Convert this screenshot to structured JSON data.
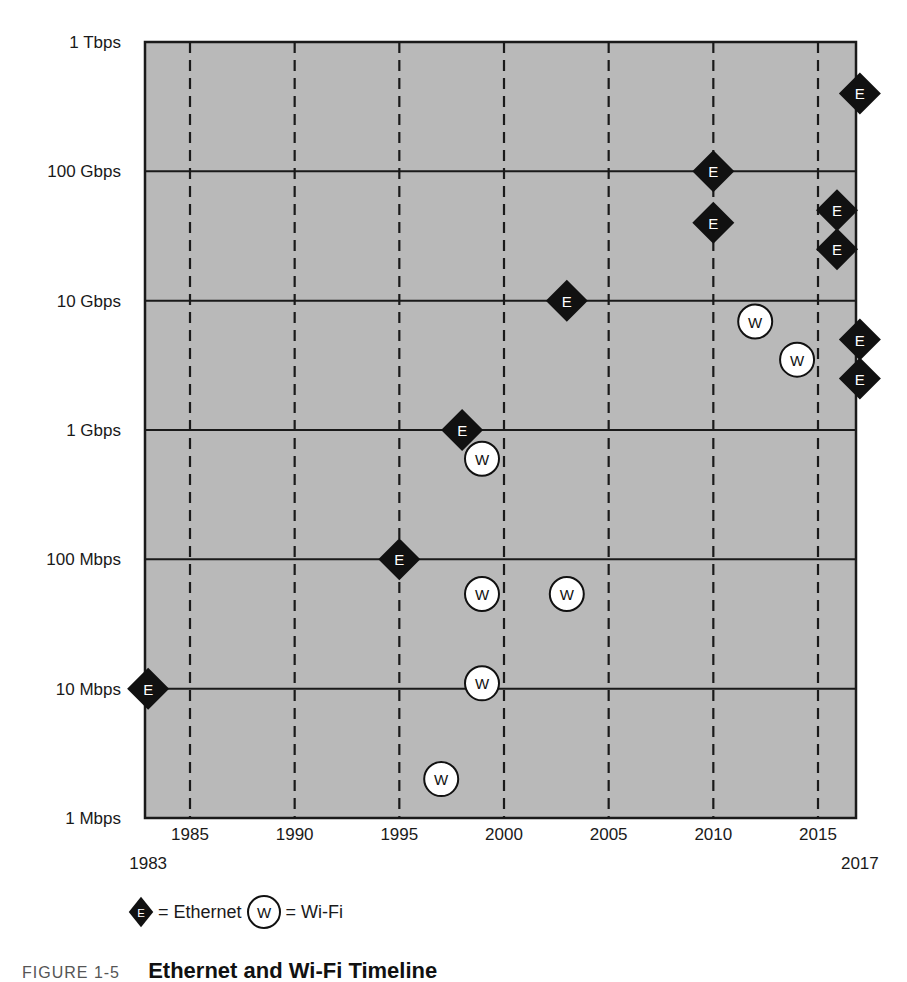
{
  "chart_data": {
    "type": "scatter",
    "title": "Ethernet and Wi-Fi Timeline",
    "xlabel": "",
    "ylabel": "",
    "xlim": [
      1983,
      2017
    ],
    "ylim_log10_mbps": [
      0,
      6
    ],
    "y_scale": "log",
    "x_ticks": [
      1985,
      1990,
      1995,
      2000,
      2005,
      2010,
      2015
    ],
    "x_extra_ticks": [
      1983,
      2017
    ],
    "y_ticks": [
      {
        "label": "1 Tbps",
        "mbps": 1000000
      },
      {
        "label": "100 Gbps",
        "mbps": 100000
      },
      {
        "label": "10 Gbps",
        "mbps": 10000
      },
      {
        "label": "1 Gbps",
        "mbps": 1000
      },
      {
        "label": "100 Mbps",
        "mbps": 100
      },
      {
        "label": "10 Mbps",
        "mbps": 10
      },
      {
        "label": "1 Mbps",
        "mbps": 1
      }
    ],
    "grid": {
      "horizontal": "solid",
      "vertical": "dashed"
    },
    "legend_position": "bottom-left",
    "series": [
      {
        "name": "Ethernet",
        "marker": "diamond",
        "letter": "E",
        "points": [
          {
            "x": 1983,
            "mbps": 10
          },
          {
            "x": 1995,
            "mbps": 100
          },
          {
            "x": 1998,
            "mbps": 1000
          },
          {
            "x": 2003,
            "mbps": 10000
          },
          {
            "x": 2010,
            "mbps": 100000
          },
          {
            "x": 2010,
            "mbps": 40000
          },
          {
            "x": 2016,
            "mbps": 50000
          },
          {
            "x": 2016,
            "mbps": 25000
          },
          {
            "x": 2017,
            "mbps": 400000
          },
          {
            "x": 2017,
            "mbps": 5000
          },
          {
            "x": 2017,
            "mbps": 2500
          }
        ]
      },
      {
        "name": "Wi-Fi",
        "marker": "circle",
        "letter": "W",
        "points": [
          {
            "x": 1997,
            "mbps": 2
          },
          {
            "x": 1999,
            "mbps": 11
          },
          {
            "x": 1999,
            "mbps": 54
          },
          {
            "x": 2003,
            "mbps": 54
          },
          {
            "x": 1999,
            "mbps": 600
          },
          {
            "x": 2012,
            "mbps": 6900
          },
          {
            "x": 2014,
            "mbps": 3500
          }
        ]
      }
    ]
  },
  "legend": {
    "ethernet_letter": "E",
    "ethernet_label": "= Ethernet",
    "wifi_letter": "W",
    "wifi_label": "= Wi-Fi"
  },
  "caption": {
    "figure": "FIGURE 1-5",
    "title": "Ethernet and Wi-Fi Timeline"
  },
  "colors": {
    "plot_bg": "#b9b9b9",
    "line": "#1a1a1a",
    "ethernet_fill": "#111111",
    "wifi_fill": "#ffffff"
  }
}
